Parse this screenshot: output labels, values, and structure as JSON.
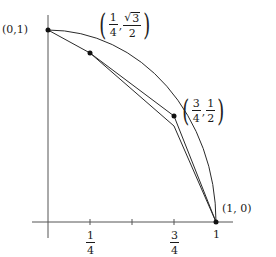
{
  "diagram": {
    "type": "geometry",
    "axes": {
      "x_ticks": [
        {
          "value": 0.25,
          "num": "1",
          "den": "4"
        },
        {
          "value": 0.5,
          "num": "",
          "den": ""
        },
        {
          "value": 0.75,
          "num": "3",
          "den": "4"
        },
        {
          "value": 1,
          "label": "1"
        }
      ]
    },
    "points": [
      {
        "name": "p0",
        "label": "(0,1)",
        "x": 0,
        "y": 1
      },
      {
        "name": "p1",
        "label_x_num": "1",
        "label_x_den": "4",
        "label_y_rad": "√",
        "label_y_under": "3",
        "label_y_den": "2",
        "x": 0.25,
        "y": 0.866
      },
      {
        "name": "p2",
        "label_x_num": "3",
        "label_x_den": "4",
        "label_y_num": "1",
        "label_y_den": "2",
        "x": 0.75,
        "y": 0.5
      },
      {
        "name": "p3",
        "label": "(1, 0)",
        "x": 1,
        "y": 0
      }
    ],
    "paren_open": "(",
    "paren_close": ")",
    "comma": ",",
    "colors": {
      "stroke": "#2a2a2a",
      "axis": "#555555",
      "point": "#111111"
    }
  }
}
